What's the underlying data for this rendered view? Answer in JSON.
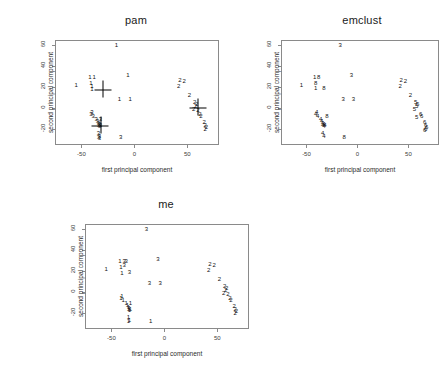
{
  "figure": {
    "background": "#ffffff",
    "axis_color": "#8a8a8a",
    "point_color": "#111111"
  },
  "chart_data": [
    {
      "type": "scatter",
      "title": "pam",
      "xlabel": "first principal component",
      "ylabel": "second principal component",
      "xlim": [
        -75,
        80
      ],
      "ylim": [
        -35,
        65
      ],
      "xticks": [
        -50,
        0,
        50
      ],
      "yticks": [
        -20,
        0,
        20,
        40,
        60
      ],
      "xticklabels": [
        "-50",
        "0",
        "50"
      ],
      "yticklabels": [
        "-20",
        "0",
        "20",
        "40",
        "60"
      ],
      "grid": false,
      "legend": "none",
      "marker_style": "cluster-number-glyph",
      "series": [
        {
          "name": "cluster 1",
          "label": "1",
          "points": [
            [
              -17,
              60
            ],
            [
              -55,
              22
            ],
            [
              -42,
              30
            ],
            [
              -38,
              30
            ],
            [
              -41,
              24
            ],
            [
              -40,
              21
            ],
            [
              -40,
              18
            ],
            [
              -6,
              32
            ],
            [
              -14,
              9
            ],
            [
              -4,
              9
            ]
          ]
        },
        {
          "name": "cluster 2",
          "label": "2",
          "points": [
            [
              43,
              27
            ],
            [
              47,
              26
            ],
            [
              42,
              21
            ],
            [
              52,
              13
            ],
            [
              57,
              6
            ],
            [
              59,
              4
            ],
            [
              58,
              2
            ],
            [
              56,
              -1
            ],
            [
              60,
              -2
            ],
            [
              62,
              -5
            ],
            [
              63,
              -7
            ],
            [
              66,
              -13
            ],
            [
              67,
              -16
            ],
            [
              68,
              -18
            ],
            [
              67,
              -20
            ]
          ]
        },
        {
          "name": "cluster 3",
          "label": "3",
          "points": [
            [
              -41,
              -5
            ],
            [
              -40,
              -4
            ],
            [
              -39,
              -7
            ],
            [
              -36,
              -10
            ],
            [
              -32,
              -10
            ],
            [
              -35,
              -12
            ],
            [
              -34,
              -14
            ],
            [
              -33,
              -15
            ],
            [
              -34,
              -16
            ],
            [
              -33,
              -17
            ],
            [
              -32,
              -16
            ],
            [
              -34,
              -24
            ],
            [
              -33,
              -26
            ],
            [
              -34,
              -27
            ],
            [
              -33,
              -28
            ],
            [
              -13,
              -27
            ]
          ]
        }
      ],
      "medoids": [
        {
          "label": "medoid-cluster-1",
          "x": -30,
          "y": 18
        },
        {
          "label": "medoid-cluster-3",
          "x": -32,
          "y": -16
        },
        {
          "label": "medoid-cluster-2",
          "x": 60,
          "y": 1
        }
      ]
    },
    {
      "type": "scatter",
      "title": "emclust",
      "xlabel": "first principal component",
      "ylabel": "second principal component",
      "xlim": [
        -75,
        80
      ],
      "ylim": [
        -35,
        65
      ],
      "xticks": [
        -50,
        0,
        50
      ],
      "yticks": [
        -20,
        0,
        20,
        40,
        60
      ],
      "xticklabels": [
        "-50",
        "0",
        "50"
      ],
      "yticklabels": [
        "-20",
        "0",
        "20",
        "40",
        "60"
      ],
      "grid": false,
      "legend": "none",
      "marker_style": "cluster-number-glyph",
      "series": [
        {
          "name": "cluster 1",
          "label": "1",
          "points": [
            [
              -55,
              22
            ],
            [
              -42,
              30
            ],
            [
              -41,
              19
            ]
          ]
        },
        {
          "name": "cluster 8",
          "label": "8",
          "points": [
            [
              -38,
              30
            ],
            [
              -41,
              24
            ],
            [
              -33,
              19
            ],
            [
              -30,
              -7
            ],
            [
              -13,
              -27
            ]
          ]
        },
        {
          "name": "cluster 3",
          "label": "3",
          "points": [
            [
              -17,
              60
            ],
            [
              -6,
              32
            ],
            [
              -14,
              9
            ],
            [
              -4,
              9
            ]
          ]
        },
        {
          "name": "cluster 2",
          "label": "2",
          "points": [
            [
              43,
              27
            ],
            [
              47,
              26
            ],
            [
              42,
              21
            ],
            [
              52,
              13
            ]
          ]
        },
        {
          "name": "cluster 4",
          "label": "4",
          "points": [
            [
              -41,
              -5
            ],
            [
              -40,
              -4
            ],
            [
              -39,
              -7
            ],
            [
              -36,
              -10
            ],
            [
              -35,
              -12
            ],
            [
              -34,
              -14
            ],
            [
              -33,
              -15
            ],
            [
              -34,
              -16
            ],
            [
              -33,
              -17
            ],
            [
              -32,
              -16
            ],
            [
              -34,
              -24
            ],
            [
              -33,
              -26
            ]
          ]
        },
        {
          "name": "cluster 5",
          "label": "5",
          "points": [
            [
              57,
              6
            ],
            [
              59,
              4
            ],
            [
              58,
              2
            ],
            [
              56,
              -1
            ],
            [
              58,
              -8
            ]
          ]
        },
        {
          "name": "cluster 6",
          "label": "6",
          "points": [
            [
              62,
              -5
            ],
            [
              63,
              -7
            ],
            [
              66,
              -13
            ],
            [
              67,
              -16
            ],
            [
              68,
              -18
            ],
            [
              67,
              -20
            ],
            [
              66,
              -21
            ]
          ]
        }
      ],
      "medoids": []
    },
    {
      "type": "scatter",
      "title": "me",
      "xlabel": "first principal component",
      "ylabel": "second principal component",
      "xlim": [
        -75,
        80
      ],
      "ylim": [
        -35,
        65
      ],
      "xticks": [
        -50,
        0,
        50
      ],
      "yticks": [
        -20,
        0,
        20,
        40,
        60
      ],
      "xticklabels": [
        "-50",
        "0",
        "50"
      ],
      "yticklabels": [
        "-20",
        "0",
        "20",
        "40",
        "60"
      ],
      "grid": false,
      "legend": "none",
      "marker_style": "cluster-number-glyph",
      "series": [
        {
          "name": "cluster 1",
          "label": "1",
          "points": [
            [
              -55,
              22
            ],
            [
              -42,
              30
            ],
            [
              -41,
              24
            ],
            [
              -40,
              18
            ],
            [
              -41,
              -5
            ],
            [
              -40,
              -4
            ],
            [
              -39,
              -7
            ],
            [
              -36,
              -10
            ],
            [
              -32,
              -10
            ],
            [
              -35,
              -12
            ],
            [
              -34,
              -14
            ],
            [
              -33,
              -15
            ],
            [
              -34,
              -16
            ],
            [
              -33,
              -17
            ],
            [
              -32,
              -16
            ],
            [
              -34,
              -24
            ],
            [
              -33,
              -26
            ],
            [
              -34,
              -27
            ],
            [
              -13,
              -27
            ]
          ]
        },
        {
          "name": "cluster 2",
          "label": "2",
          "points": [
            [
              43,
              27
            ],
            [
              47,
              26
            ],
            [
              42,
              21
            ],
            [
              52,
              13
            ],
            [
              57,
              6
            ],
            [
              59,
              4
            ],
            [
              58,
              2
            ],
            [
              56,
              -1
            ],
            [
              60,
              -2
            ],
            [
              62,
              -5
            ],
            [
              63,
              -7
            ],
            [
              66,
              -13
            ],
            [
              67,
              -16
            ],
            [
              68,
              -18
            ],
            [
              67,
              -20
            ]
          ]
        },
        {
          "name": "cluster 3",
          "label": "3",
          "points": [
            [
              -17,
              60
            ],
            [
              -38,
              30
            ],
            [
              -36,
              30
            ],
            [
              -38,
              26
            ],
            [
              -33,
              19
            ],
            [
              -6,
              32
            ],
            [
              -14,
              9
            ],
            [
              -4,
              9
            ]
          ]
        }
      ],
      "medoids": []
    }
  ]
}
